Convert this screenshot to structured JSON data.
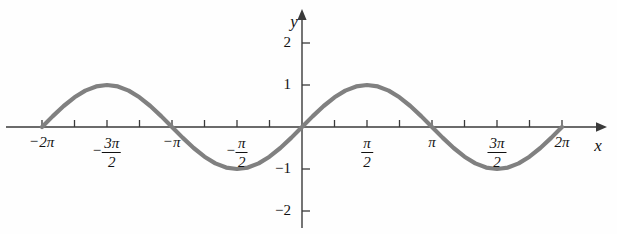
{
  "figure": {
    "name": "sine-curve-graph",
    "background_color": "#fefefe",
    "curve_color": "#808080",
    "axis_color": "#3a3a3a",
    "x_axis_name": "x",
    "y_axis_name": "y"
  },
  "chart_data": {
    "type": "line",
    "title": "",
    "subtitle": "",
    "xlabel": "x",
    "ylabel": "y",
    "function": "y = sin(x)",
    "xlim": [
      -6.283185307179586,
      6.283185307179586
    ],
    "ylim": [
      -2.6,
      2.6
    ],
    "grid": false,
    "legend": null,
    "x_tick_labels": [
      "-2π",
      "-3π/2",
      "-π",
      "-π/2",
      "π/2",
      "π",
      "3π/2",
      "2π"
    ],
    "x_tick_values": [
      -6.283185307,
      -4.71238898,
      -3.141592653,
      -1.570796327,
      1.570796327,
      3.141592653,
      4.71238898,
      6.283185307
    ],
    "x_minor_tick_values": [
      -5.497787144,
      -3.926990817,
      -2.35619449,
      -0.785398163,
      0.785398163,
      2.35619449,
      3.926990817,
      5.497787144
    ],
    "y_tick_labels": [
      "2",
      "1",
      "-1",
      "-2"
    ],
    "y_tick_values": [
      2,
      1,
      -1,
      -2
    ],
    "series": [
      {
        "name": "sin(x)",
        "color": "#808080",
        "x": [
          -6.283185307,
          -6.021385919,
          -5.759586532,
          -5.497787144,
          -5.235987756,
          -4.974188368,
          -4.71238898,
          -4.450589593,
          -4.188790205,
          -3.926990817,
          -3.665191429,
          -3.403392041,
          -3.141592653,
          -2.879793266,
          -2.617993878,
          -2.35619449,
          -2.094395102,
          -1.832595715,
          -1.570796327,
          -1.308996939,
          -1.047197551,
          -0.785398163,
          -0.523598776,
          -0.261799388,
          0.0,
          0.261799388,
          0.523598776,
          0.785398163,
          1.047197551,
          1.308996939,
          1.570796327,
          1.832595715,
          2.094395102,
          2.35619449,
          2.617993878,
          2.879793266,
          3.141592653,
          3.403392041,
          3.665191429,
          3.926990817,
          4.188790205,
          4.450589593,
          4.71238898,
          4.974188368,
          5.235987756,
          5.497787144,
          5.759586532,
          6.021385919,
          6.283185307
        ],
        "y": [
          0.0,
          0.258819045,
          0.5,
          0.707106781,
          0.866025404,
          0.965925826,
          1.0,
          0.965925826,
          0.866025404,
          0.707106781,
          0.5,
          0.258819045,
          0.0,
          -0.258819045,
          -0.5,
          -0.707106781,
          -0.866025404,
          -0.965925826,
          -1.0,
          -0.965925826,
          -0.866025404,
          -0.707106781,
          -0.5,
          -0.258819045,
          0.0,
          0.258819045,
          0.5,
          0.707106781,
          0.866025404,
          0.965925826,
          1.0,
          0.965925826,
          0.866025404,
          0.707106781,
          0.5,
          0.258819045,
          0.0,
          -0.258819045,
          -0.5,
          -0.707106781,
          -0.866025404,
          -0.965925826,
          -1.0,
          -0.965925826,
          -0.866025404,
          -0.707106781,
          -0.5,
          -0.258819045,
          0.0
        ]
      }
    ]
  },
  "x_axis": {
    "labels": [
      {
        "id": "x-tick-label-neg-2pi",
        "text": "2π",
        "sign": "−",
        "fraction": false,
        "numerator": "",
        "denominator": "",
        "value": -6.283185307
      },
      {
        "id": "x-tick-label-neg-3pi-over-2",
        "text": "3π/2",
        "sign": "−",
        "fraction": true,
        "numerator": "3π",
        "denominator": "2",
        "value": -4.71238898
      },
      {
        "id": "x-tick-label-neg-pi",
        "text": "π",
        "sign": "−",
        "fraction": false,
        "numerator": "",
        "denominator": "",
        "value": -3.141592653
      },
      {
        "id": "x-tick-label-neg-pi-over-2",
        "text": "π/2",
        "sign": "−",
        "fraction": true,
        "numerator": "π",
        "denominator": "2",
        "value": -1.570796327
      },
      {
        "id": "x-tick-label-pi-over-2",
        "text": "π/2",
        "sign": "",
        "fraction": true,
        "numerator": "π",
        "denominator": "2",
        "value": 1.570796327
      },
      {
        "id": "x-tick-label-pi",
        "text": "π",
        "sign": "",
        "fraction": false,
        "numerator": "",
        "denominator": "",
        "value": 3.141592653
      },
      {
        "id": "x-tick-label-3pi-over-2",
        "text": "3π/2",
        "sign": "",
        "fraction": true,
        "numerator": "3π",
        "denominator": "2",
        "value": 4.71238898
      },
      {
        "id": "x-tick-label-2pi",
        "text": "2π",
        "sign": "",
        "fraction": false,
        "numerator": "",
        "denominator": "",
        "value": 6.283185307
      }
    ]
  },
  "y_axis": {
    "labels": [
      {
        "id": "y-tick-label-2",
        "text": "2",
        "value": 2
      },
      {
        "id": "y-tick-label-1",
        "text": "1",
        "value": 1
      },
      {
        "id": "y-tick-label-neg-1",
        "text": "−1",
        "value": -1
      },
      {
        "id": "y-tick-label-neg-2",
        "text": "−2",
        "value": -2
      }
    ]
  }
}
